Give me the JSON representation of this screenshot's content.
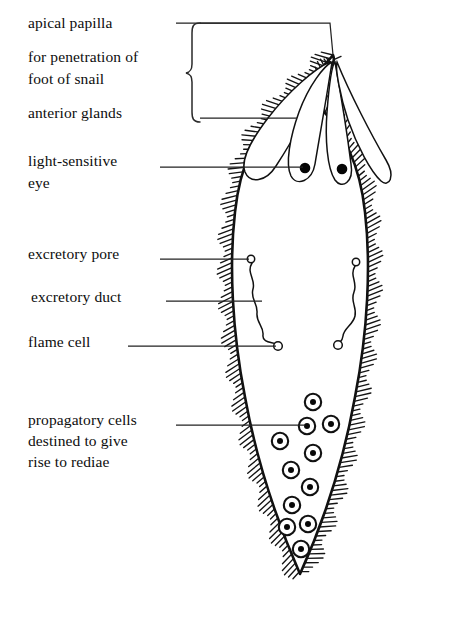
{
  "figure": {
    "background": "#ffffff",
    "ink": "#111111",
    "width": 451,
    "height": 631
  },
  "labels": [
    {
      "id": "apical-papilla",
      "text": "apical papilla",
      "x": 28,
      "y": 14
    },
    {
      "id": "penetration-1",
      "text": "for penetration of",
      "x": 28,
      "y": 48
    },
    {
      "id": "penetration-2",
      "text": "foot of snail",
      "x": 28,
      "y": 70
    },
    {
      "id": "anterior-glands",
      "text": "anterior glands",
      "x": 28,
      "y": 104
    },
    {
      "id": "eye-1",
      "text": "light-sensitive",
      "x": 28,
      "y": 152
    },
    {
      "id": "eye-2",
      "text": "eye",
      "x": 28,
      "y": 174
    },
    {
      "id": "excretory-pore",
      "text": "excretory pore",
      "x": 28,
      "y": 245
    },
    {
      "id": "excretory-duct",
      "text": "excretory duct",
      "x": 31,
      "y": 288
    },
    {
      "id": "flame-cell",
      "text": "flame cell",
      "x": 28,
      "y": 333
    },
    {
      "id": "propagatory-1",
      "text": "propagatory cells",
      "x": 28,
      "y": 411
    },
    {
      "id": "propagatory-2",
      "text": "destined to give",
      "x": 28,
      "y": 432
    },
    {
      "id": "propagatory-3",
      "text": "rise to rediae",
      "x": 28,
      "y": 453
    }
  ],
  "leader_lines": [
    {
      "id": "leader-apical-papilla",
      "points": "176,23 330,23 333,55"
    },
    {
      "id": "leader-brace-top",
      "points": "200,23 300,23"
    },
    {
      "id": "leader-anterior-glands",
      "points": "200,118 297,118"
    },
    {
      "id": "leader-eye",
      "points": "160,167 303,167"
    },
    {
      "id": "leader-excretory-pore",
      "points": "160,259 249,259"
    },
    {
      "id": "leader-excretory-duct",
      "points": "166,301 262,301"
    },
    {
      "id": "leader-flame-cell",
      "points": "128,346 276,346"
    },
    {
      "id": "leader-propagatory",
      "points": "176,425 305,425"
    }
  ],
  "brace": {
    "id": "label-brace",
    "x": 192,
    "top": 23,
    "bottom": 122
  },
  "anatomy": {
    "body_outline": "teardrop ovoid with pointed apical papilla at top and V point at base",
    "cilia": "dense radiating hatch marks around entire body margin",
    "anterior_glands": [
      {
        "id": "gland-1",
        "label": "anterior gland"
      },
      {
        "id": "gland-2",
        "label": "anterior gland"
      },
      {
        "id": "gland-3",
        "label": "anterior gland"
      },
      {
        "id": "gland-4",
        "label": "anterior gland"
      }
    ],
    "eyes": [
      {
        "id": "eye-left",
        "cx": 305,
        "cy": 168,
        "r": 5.2
      },
      {
        "id": "eye-right",
        "cx": 342,
        "cy": 169,
        "r": 5.2
      }
    ],
    "excretory_systems": [
      {
        "id": "excretory-left",
        "pore": {
          "cx": 251,
          "cy": 259,
          "r": 3.6
        },
        "flame": {
          "cx": 278,
          "cy": 346,
          "r": 4.2
        }
      },
      {
        "id": "excretory-right",
        "pore": {
          "cx": 356,
          "cy": 262,
          "r": 3.6
        },
        "flame": {
          "cx": 338,
          "cy": 345,
          "r": 4.2
        }
      }
    ],
    "propagatory_cells": [
      {
        "id": "propagatory-cell-1",
        "cx": 313,
        "cy": 402,
        "r": 8.2,
        "nr": 3.0
      },
      {
        "id": "propagatory-cell-2",
        "cx": 307,
        "cy": 426,
        "r": 8.2,
        "nr": 3.0
      },
      {
        "id": "propagatory-cell-3",
        "cx": 331,
        "cy": 424,
        "r": 8.2,
        "nr": 3.0
      },
      {
        "id": "propagatory-cell-4",
        "cx": 280,
        "cy": 441,
        "r": 8.2,
        "nr": 3.0
      },
      {
        "id": "propagatory-cell-5",
        "cx": 313,
        "cy": 453,
        "r": 8.2,
        "nr": 3.0
      },
      {
        "id": "propagatory-cell-6",
        "cx": 291,
        "cy": 470,
        "r": 8.2,
        "nr": 3.0
      },
      {
        "id": "propagatory-cell-7",
        "cx": 310,
        "cy": 487,
        "r": 8.2,
        "nr": 3.0
      },
      {
        "id": "propagatory-cell-8",
        "cx": 292,
        "cy": 505,
        "r": 8.2,
        "nr": 3.0
      },
      {
        "id": "propagatory-cell-9",
        "cx": 287,
        "cy": 527,
        "r": 8.2,
        "nr": 3.0
      },
      {
        "id": "propagatory-cell-10",
        "cx": 308,
        "cy": 524,
        "r": 8.2,
        "nr": 3.0
      },
      {
        "id": "propagatory-cell-11",
        "cx": 301,
        "cy": 549,
        "r": 8.2,
        "nr": 3.0
      }
    ]
  }
}
